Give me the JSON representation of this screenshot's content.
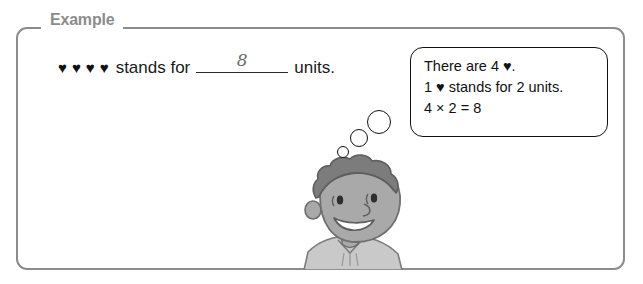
{
  "panel": {
    "legend_label": "Example"
  },
  "question": {
    "hearts": [
      "♥",
      "♥",
      "♥",
      "♥"
    ],
    "stands_for_text": "stands for",
    "answer_value": "8",
    "units_text": "units."
  },
  "thought_bubble": {
    "lines": [
      "There are 4 ♥.",
      "1 ♥ stands for 2 units.",
      "4 × 2 = 8"
    ]
  },
  "trail": {
    "large_label": "thought-circle-large",
    "medium_label": "thought-circle-medium",
    "small_label": "thought-circle-small"
  },
  "character": {
    "description": "smiling child with curly hair",
    "hair_color": "#7c7c7c",
    "skin_color": "#a9a9a9",
    "outline_color": "#5f5f5f",
    "shirt_color": "#c9c9c9"
  },
  "colors": {
    "panel_border": "#8c8c8c",
    "legend_text": "#8c8c8c",
    "body_text": "#1a1a1a",
    "handwriting": "#6e6e6e",
    "bubble_border": "#111111",
    "background": "#ffffff"
  }
}
